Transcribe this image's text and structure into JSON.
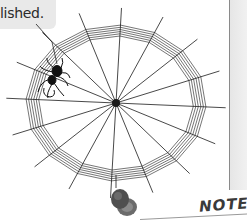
{
  "caption": {
    "text": "lished.",
    "box_color": "#e9e9e9"
  },
  "illustration": {
    "subject": "spider web with spider",
    "web_center": [
      116,
      103
    ],
    "spoke_count": 16,
    "ring_count": 6,
    "icons": [
      "spider-icon",
      "thumbtack-icon"
    ]
  },
  "note": {
    "label": "NOTE"
  },
  "colors": {
    "ink": "#1a1a1a",
    "divider": "#8a8a8a",
    "band": "#ececec",
    "thumbtack": "#5a5a5a"
  }
}
